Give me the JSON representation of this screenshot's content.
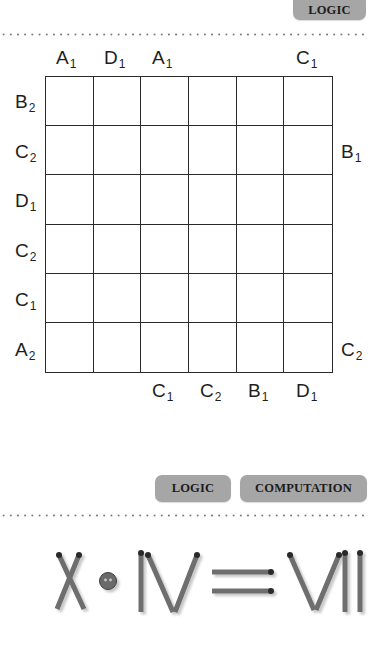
{
  "top_section": {
    "tag": "LOGIC"
  },
  "grid_puzzle": {
    "rows": 6,
    "cols": 6,
    "top_labels": [
      {
        "col": 0,
        "letter": "A",
        "sub": "1"
      },
      {
        "col": 1,
        "letter": "D",
        "sub": "1"
      },
      {
        "col": 2,
        "letter": "A",
        "sub": "1"
      },
      {
        "col": 5,
        "letter": "C",
        "sub": "1"
      }
    ],
    "left_labels": [
      {
        "row": 0,
        "letter": "B",
        "sub": "2"
      },
      {
        "row": 1,
        "letter": "C",
        "sub": "2"
      },
      {
        "row": 2,
        "letter": "D",
        "sub": "1"
      },
      {
        "row": 3,
        "letter": "C",
        "sub": "2"
      },
      {
        "row": 4,
        "letter": "C",
        "sub": "1"
      },
      {
        "row": 5,
        "letter": "A",
        "sub": "2"
      }
    ],
    "right_labels": [
      {
        "row": 1,
        "letter": "B",
        "sub": "1"
      },
      {
        "row": 5,
        "letter": "C",
        "sub": "2"
      }
    ],
    "bottom_labels": [
      {
        "col": 2,
        "letter": "C",
        "sub": "1"
      },
      {
        "col": 3,
        "letter": "C",
        "sub": "2"
      },
      {
        "col": 4,
        "letter": "B",
        "sub": "1"
      },
      {
        "col": 5,
        "letter": "D",
        "sub": "1"
      }
    ]
  },
  "bottom_section": {
    "tags": [
      "LOGIC",
      "COMPUTATION"
    ],
    "matchstick_equation": {
      "left": "X",
      "operator": "·",
      "middle": "IV",
      "equals": "=",
      "right": "VII",
      "text": "X · IV = VII"
    }
  },
  "colors": {
    "badge_bg": "#a6a6a6",
    "match_stick": "#6e6e6e",
    "match_head": "#2a2a2a",
    "grid_line": "#2a2a2a"
  }
}
